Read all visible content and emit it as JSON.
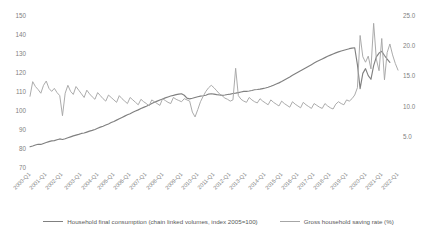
{
  "chart_data": {
    "type": "line",
    "title": "",
    "xlabel": "",
    "ylabel": "",
    "y2label": "",
    "grid": false,
    "legend_position": "bottom",
    "ylim": [
      70,
      150
    ],
    "y2lim": [
      0,
      25
    ],
    "yticks": [
      "70",
      "80",
      "90",
      "100",
      "110",
      "120",
      "130",
      "140",
      "150"
    ],
    "y2ticks": [
      "5.0",
      "10.0",
      "15.0",
      "20.0",
      "25.0"
    ],
    "y2tick_values": [
      5,
      10,
      15,
      20,
      25
    ],
    "ytick_values": [
      70,
      80,
      90,
      100,
      110,
      120,
      130,
      140,
      150
    ],
    "xticks": [
      "2000-Q1",
      "2001-Q1",
      "2002-Q1",
      "2003-Q1",
      "2004-Q1",
      "2005-Q1",
      "2006-Q1",
      "2007-Q1",
      "2008-Q1",
      "2009-Q1",
      "2010-Q1",
      "2011-Q1",
      "2012-Q1",
      "2013-Q1",
      "2014-Q1",
      "2015-Q1",
      "2016-Q1",
      "2017-Q1",
      "2018-Q1",
      "2019-Q1",
      "2020-Q1",
      "2021-Q1",
      "2022-Q1"
    ],
    "series": [
      {
        "name": "Household final consumption (chain linked volumes, index 2005=100)",
        "axis": "left",
        "color": "#808080",
        "values": [
          81.2,
          81.6,
          82.1,
          82.5,
          82.4,
          82.9,
          83.4,
          83.9,
          84.3,
          84.4,
          84.9,
          85.3,
          85.0,
          85.4,
          85.9,
          86.4,
          86.9,
          87.3,
          87.7,
          88.2,
          88.4,
          88.9,
          89.4,
          89.8,
          90.3,
          90.9,
          91.5,
          92.0,
          92.6,
          93.2,
          93.9,
          94.5,
          95.2,
          95.9,
          96.6,
          97.3,
          98.0,
          98.6,
          99.3,
          100.0,
          100.6,
          101.3,
          101.9,
          102.5,
          103.2,
          103.9,
          104.6,
          105.2,
          105.8,
          106.3,
          106.9,
          107.4,
          107.9,
          108.2,
          108.6,
          108.9,
          109.1,
          108.3,
          106.8,
          106.4,
          106.7,
          107.1,
          107.5,
          107.8,
          108.0,
          108.3,
          108.9,
          109.1,
          108.9,
          108.6,
          108.4,
          108.2,
          108.4,
          108.7,
          108.9,
          109.2,
          109.4,
          109.7,
          110.0,
          110.3,
          110.3,
          110.5,
          110.8,
          111.2,
          111.3,
          111.5,
          111.8,
          112.1,
          112.5,
          113.0,
          113.6,
          114.2,
          114.8,
          115.5,
          116.3,
          117.1,
          117.9,
          118.8,
          119.6,
          120.4,
          121.2,
          122.0,
          122.8,
          123.6,
          124.4,
          125.2,
          126.0,
          126.7,
          127.4,
          128.1,
          128.8,
          129.4,
          130.0,
          130.6,
          131.1,
          131.6,
          132.0,
          132.4,
          132.8,
          133.1,
          133.3,
          124.4,
          111.8,
          119.8,
          122.3,
          118.6,
          116.7,
          123.9,
          128.5,
          130.5,
          131.4,
          129.2,
          127.3,
          125.6
        ]
      },
      {
        "name": "Gross household saving rate (%)",
        "axis": "right",
        "color": "#a6a6a6",
        "values": [
          11.8,
          14.2,
          13.4,
          12.9,
          12.3,
          13.6,
          14.3,
          13.1,
          12.6,
          13.1,
          12.4,
          11.9,
          8.6,
          12.3,
          13.6,
          12.6,
          12.1,
          13.4,
          12.8,
          12.2,
          11.6,
          12.8,
          12.2,
          11.7,
          11.3,
          12.4,
          11.9,
          11.4,
          11.0,
          12.0,
          11.6,
          11.2,
          10.8,
          11.9,
          11.4,
          11.0,
          10.6,
          11.6,
          11.2,
          10.8,
          10.4,
          11.3,
          10.9,
          10.6,
          10.2,
          11.2,
          10.9,
          10.6,
          10.3,
          11.4,
          11.1,
          10.8,
          10.6,
          11.6,
          11.3,
          11.1,
          10.9,
          11.4,
          11.2,
          11.0,
          9.2,
          8.4,
          9.6,
          10.9,
          11.8,
          12.6,
          13.2,
          13.6,
          13.2,
          12.7,
          12.2,
          11.9,
          11.5,
          11.3,
          11.0,
          11.2,
          16.4,
          11.9,
          11.3,
          11.0,
          10.8,
          11.6,
          11.2,
          10.9,
          10.7,
          11.4,
          11.0,
          10.7,
          10.4,
          11.2,
          10.8,
          10.5,
          10.2,
          11.0,
          10.6,
          10.3,
          10.0,
          10.9,
          10.5,
          10.2,
          9.9,
          10.8,
          10.4,
          10.1,
          9.8,
          10.6,
          10.3,
          10.0,
          9.8,
          10.6,
          10.2,
          9.9,
          9.7,
          10.5,
          10.9,
          10.6,
          10.4,
          11.2,
          11.0,
          11.4,
          12.0,
          13.2,
          21.8,
          18.3,
          17.4,
          18.4,
          16.3,
          23.8,
          17.9,
          16.0,
          21.3,
          14.5,
          19.0,
          20.4,
          18.6,
          17.2,
          16.1
        ]
      }
    ]
  },
  "legend": {
    "items": [
      {
        "label": "Household final consumption (chain linked volumes, index 2005=100)",
        "color": "#808080"
      },
      {
        "label": "Gross household saving rate (%)",
        "color": "#a6a6a6"
      }
    ]
  }
}
